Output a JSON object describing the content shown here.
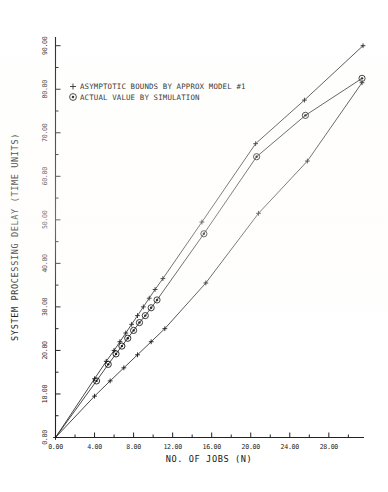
{
  "chart_data": {
    "type": "line",
    "title": "",
    "xlabel": "NO. OF JOBS (N)",
    "ylabel": "SYSTEM PROCESSING DELAY (TIME UNITS)",
    "xlim": [
      0,
      31.5
    ],
    "ylim": [
      0,
      92
    ],
    "grid": false,
    "legend_position": "upper-left-inside",
    "xticks": [
      "0.00",
      "4.00",
      "8.00",
      "12.00",
      "16.00",
      "20.00",
      "24.00",
      "28.00"
    ],
    "xtick_values": [
      0,
      4,
      8,
      12,
      16,
      20,
      24,
      28
    ],
    "yticks": [
      "0.00",
      "10.00",
      "20.00",
      "30.00",
      "40.00",
      "50.00",
      "60.00",
      "70.00",
      "80.00",
      "90.00"
    ],
    "ytick_values": [
      0,
      10,
      20,
      30,
      40,
      50,
      60,
      70,
      80,
      90
    ],
    "minor_tick_step_x": 2,
    "minor_tick_step_y": 5,
    "series": [
      {
        "name": "ASYMPTOTIC BOUNDS BY APPROX MODEL #1",
        "marker": "plus",
        "label_key": "upper_bound",
        "x": [
          0.0,
          4.0,
          5.2,
          6.0,
          6.6,
          7.2,
          7.8,
          8.4,
          9.0,
          9.6,
          10.2,
          11.0,
          15.0,
          20.5,
          25.5,
          31.5
        ],
        "y": [
          0.0,
          13.5,
          17.5,
          20.0,
          22.0,
          24.0,
          26.0,
          28.0,
          30.0,
          32.0,
          34.0,
          36.5,
          49.5,
          67.5,
          77.5,
          90.0
        ]
      },
      {
        "name": "ACTUAL VALUE BY SIMULATION",
        "marker": "circle-dot",
        "label_key": "simulation",
        "x": [
          0.0,
          4.2,
          5.4,
          6.2,
          6.8,
          7.4,
          8.0,
          8.6,
          9.2,
          9.8,
          10.4,
          15.2,
          20.6,
          25.6,
          31.4
        ],
        "y": [
          0.0,
          13.0,
          16.8,
          19.2,
          21.0,
          22.8,
          24.6,
          26.4,
          28.0,
          29.8,
          31.6,
          46.8,
          64.5,
          74.0,
          82.5
        ]
      },
      {
        "name": "ASYMPTOTIC LOWER BOUND",
        "marker": "plus",
        "label_key": "lower_bound",
        "x": [
          0.0,
          4.0,
          5.6,
          7.0,
          8.4,
          9.8,
          11.2,
          15.4,
          20.8,
          25.8,
          31.4
        ],
        "y": [
          0.0,
          9.5,
          13.0,
          16.0,
          19.0,
          22.0,
          25.0,
          35.5,
          51.5,
          63.5,
          81.5
        ]
      }
    ]
  },
  "legend": {
    "entries": [
      {
        "marker": "+",
        "label": "ASYMPTOTIC BOUNDS BY APPROX MODEL #1"
      },
      {
        "marker": "circle",
        "label": "ACTUAL VALUE BY SIMULATION"
      }
    ]
  },
  "axes": {
    "x_title": "NO. OF JOBS (N)",
    "y_title": "SYSTEM PROCESSING DELAY (TIME UNITS)"
  }
}
